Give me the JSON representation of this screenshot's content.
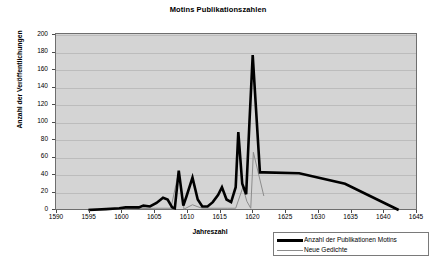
{
  "chart_data": {
    "type": "line",
    "title": "Motins Publikationszahlen",
    "xlabel": "Jahreszahl",
    "ylabel": "Anzahl der Veröffentlichungen",
    "xlim": [
      1590,
      1645
    ],
    "ylim": [
      0,
      200
    ],
    "xticks": [
      1590,
      1595,
      1600,
      1605,
      1610,
      1615,
      1620,
      1625,
      1630,
      1635,
      1640,
      1645
    ],
    "yticks": [
      0,
      20,
      40,
      60,
      80,
      100,
      120,
      140,
      160,
      180,
      200
    ],
    "grid": "horizontal",
    "legend_position": "bottom-right",
    "plot_background": "#d4d4d4",
    "series": [
      {
        "name": "Anzahl der Publikationen Motins",
        "color": "#000000",
        "width": 2.6,
        "x": [
          1594.8,
          1597.5,
          1599.5,
          1600.5,
          1601.5,
          1602.5,
          1603.2,
          1604.2,
          1605.2,
          1606.2,
          1606.9,
          1607.6,
          1608.0,
          1608.6,
          1609.3,
          1609.8,
          1610.7,
          1611.5,
          1612.2,
          1613.0,
          1613.8,
          1614.6,
          1615.2,
          1615.9,
          1616.6,
          1617.3,
          1617.7,
          1618.3,
          1618.9,
          1619.4,
          1619.9,
          1621.0,
          1621.6,
          1627.0,
          1634.0,
          1642.2
        ],
        "y": [
          0,
          1,
          2,
          3,
          3,
          3,
          5,
          4,
          8,
          14,
          12,
          3,
          2,
          45,
          5,
          16,
          37,
          12,
          4,
          4,
          9,
          17,
          26,
          12,
          9,
          26,
          89,
          30,
          18,
          100,
          177,
          43,
          43,
          42,
          30,
          0
        ]
      },
      {
        "name": "Neue Gedichte",
        "color": "#8c8c8c",
        "width": 1.0,
        "x": [
          1594.8,
          1600.0,
          1605.0,
          1607.4,
          1608.6,
          1609.4,
          1610.7,
          1611.4,
          1612.2,
          1614.0,
          1615.2,
          1616.0,
          1617.3,
          1618.4,
          1619.0,
          1619.6,
          1620.0,
          1621.6
        ],
        "y": [
          1,
          1,
          2,
          2,
          44,
          1,
          6,
          4,
          2,
          2,
          2,
          2,
          2,
          26,
          10,
          2,
          66,
          16
        ]
      }
    ]
  },
  "legend": {
    "items": [
      {
        "label": "Anzahl der Publikationen Motins",
        "style": "thick"
      },
      {
        "label": "Neue Gedichte",
        "style": "thin"
      }
    ]
  }
}
